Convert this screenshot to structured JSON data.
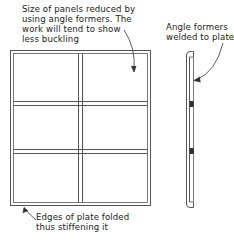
{
  "diagram": {
    "views": [
      {
        "name": "front-elevation",
        "panels_grid": {
          "columns": 2,
          "rows": 3
        }
      },
      {
        "name": "side-section",
        "angle_former_positions": 2
      }
    ],
    "annotations": {
      "panel_note": "Size of panels reduced by\nusing angle formers. The\nwork will tend to show\nless buckling",
      "former_note": "Angle formers\nwelded to plate",
      "edge_note": "Edges of plate folded\nthus stiffening it"
    },
    "colors": {
      "line": "#555555",
      "text": "#222222",
      "background": "#ffffff"
    }
  }
}
